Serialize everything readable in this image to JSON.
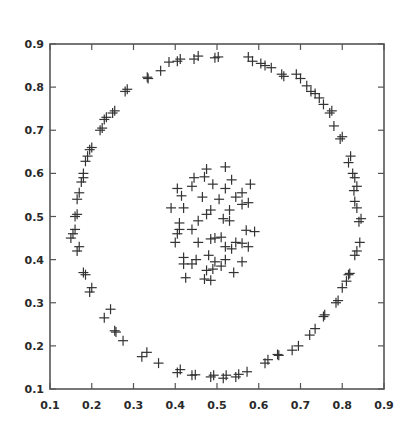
{
  "chart_data": {
    "type": "scatter",
    "title": "",
    "xlabel": "",
    "ylabel": "",
    "xlim": [
      0.1,
      0.9
    ],
    "ylim": [
      0.1,
      0.9
    ],
    "grid": false,
    "legend": null,
    "marker": "+",
    "marker_color": "#333333",
    "x_ticks": [
      "0.1",
      "0.2",
      "0.3",
      "0.4",
      "0.5",
      "0.6",
      "0.7",
      "0.8",
      "0.9"
    ],
    "y_ticks": [
      "0.1",
      "0.2",
      "0.3",
      "0.4",
      "0.5",
      "0.6",
      "0.7",
      "0.8",
      "0.9"
    ],
    "series": [
      {
        "name": "outer ring",
        "points": [
          [
            0.495,
            0.868
          ],
          [
            0.503,
            0.87
          ],
          [
            0.445,
            0.865
          ],
          [
            0.455,
            0.872
          ],
          [
            0.405,
            0.86
          ],
          [
            0.412,
            0.865
          ],
          [
            0.385,
            0.858
          ],
          [
            0.365,
            0.838
          ],
          [
            0.335,
            0.82
          ],
          [
            0.333,
            0.823
          ],
          [
            0.28,
            0.79
          ],
          [
            0.285,
            0.795
          ],
          [
            0.255,
            0.745
          ],
          [
            0.25,
            0.74
          ],
          [
            0.23,
            0.725
          ],
          [
            0.235,
            0.73
          ],
          [
            0.22,
            0.7
          ],
          [
            0.225,
            0.705
          ],
          [
            0.195,
            0.655
          ],
          [
            0.2,
            0.66
          ],
          [
            0.185,
            0.628
          ],
          [
            0.19,
            0.64
          ],
          [
            0.18,
            0.6
          ],
          [
            0.175,
            0.58
          ],
          [
            0.18,
            0.59
          ],
          [
            0.17,
            0.555
          ],
          [
            0.165,
            0.54
          ],
          [
            0.16,
            0.5
          ],
          [
            0.165,
            0.505
          ],
          [
            0.155,
            0.46
          ],
          [
            0.16,
            0.47
          ],
          [
            0.15,
            0.45
          ],
          [
            0.17,
            0.43
          ],
          [
            0.165,
            0.42
          ],
          [
            0.18,
            0.37
          ],
          [
            0.185,
            0.365
          ],
          [
            0.2,
            0.335
          ],
          [
            0.195,
            0.325
          ],
          [
            0.23,
            0.265
          ],
          [
            0.245,
            0.285
          ],
          [
            0.255,
            0.235
          ],
          [
            0.258,
            0.232
          ],
          [
            0.275,
            0.212
          ],
          [
            0.32,
            0.175
          ],
          [
            0.332,
            0.185
          ],
          [
            0.36,
            0.16
          ],
          [
            0.405,
            0.138
          ],
          [
            0.412,
            0.145
          ],
          [
            0.44,
            0.132
          ],
          [
            0.448,
            0.133
          ],
          [
            0.485,
            0.128
          ],
          [
            0.492,
            0.132
          ],
          [
            0.515,
            0.125
          ],
          [
            0.522,
            0.132
          ],
          [
            0.545,
            0.128
          ],
          [
            0.552,
            0.134
          ],
          [
            0.572,
            0.14
          ],
          [
            0.615,
            0.16
          ],
          [
            0.622,
            0.168
          ],
          [
            0.645,
            0.18
          ],
          [
            0.648,
            0.178
          ],
          [
            0.68,
            0.19
          ],
          [
            0.695,
            0.2
          ],
          [
            0.722,
            0.225
          ],
          [
            0.735,
            0.24
          ],
          [
            0.755,
            0.268
          ],
          [
            0.758,
            0.272
          ],
          [
            0.785,
            0.3
          ],
          [
            0.79,
            0.305
          ],
          [
            0.8,
            0.335
          ],
          [
            0.81,
            0.35
          ],
          [
            0.815,
            0.365
          ],
          [
            0.818,
            0.368
          ],
          [
            0.83,
            0.41
          ],
          [
            0.835,
            0.42
          ],
          [
            0.842,
            0.44
          ],
          [
            0.84,
            0.488
          ],
          [
            0.845,
            0.495
          ],
          [
            0.835,
            0.52
          ],
          [
            0.83,
            0.535
          ],
          [
            0.828,
            0.56
          ],
          [
            0.835,
            0.57
          ],
          [
            0.83,
            0.59
          ],
          [
            0.825,
            0.6
          ],
          [
            0.815,
            0.625
          ],
          [
            0.82,
            0.64
          ],
          [
            0.795,
            0.68
          ],
          [
            0.8,
            0.685
          ],
          [
            0.78,
            0.71
          ],
          [
            0.77,
            0.74
          ],
          [
            0.775,
            0.745
          ],
          [
            0.755,
            0.76
          ],
          [
            0.745,
            0.775
          ],
          [
            0.735,
            0.785
          ],
          [
            0.725,
            0.79
          ],
          [
            0.715,
            0.803
          ],
          [
            0.7,
            0.82
          ],
          [
            0.69,
            0.83
          ],
          [
            0.66,
            0.825
          ],
          [
            0.655,
            0.83
          ],
          [
            0.63,
            0.845
          ],
          [
            0.615,
            0.85
          ],
          [
            0.605,
            0.855
          ],
          [
            0.585,
            0.86
          ],
          [
            0.575,
            0.87
          ]
        ]
      },
      {
        "name": "inner cluster",
        "points": [
          [
            0.475,
            0.61
          ],
          [
            0.52,
            0.615
          ],
          [
            0.445,
            0.59
          ],
          [
            0.47,
            0.592
          ],
          [
            0.535,
            0.585
          ],
          [
            0.58,
            0.575
          ],
          [
            0.49,
            0.575
          ],
          [
            0.405,
            0.565
          ],
          [
            0.44,
            0.57
          ],
          [
            0.52,
            0.565
          ],
          [
            0.56,
            0.555
          ],
          [
            0.545,
            0.545
          ],
          [
            0.415,
            0.548
          ],
          [
            0.465,
            0.545
          ],
          [
            0.505,
            0.54
          ],
          [
            0.56,
            0.528
          ],
          [
            0.575,
            0.532
          ],
          [
            0.39,
            0.52
          ],
          [
            0.42,
            0.52
          ],
          [
            0.485,
            0.515
          ],
          [
            0.475,
            0.505
          ],
          [
            0.53,
            0.515
          ],
          [
            0.515,
            0.495
          ],
          [
            0.53,
            0.49
          ],
          [
            0.455,
            0.49
          ],
          [
            0.41,
            0.485
          ],
          [
            0.41,
            0.47
          ],
          [
            0.44,
            0.47
          ],
          [
            0.405,
            0.46
          ],
          [
            0.57,
            0.468
          ],
          [
            0.59,
            0.465
          ],
          [
            0.495,
            0.45
          ],
          [
            0.51,
            0.452
          ],
          [
            0.485,
            0.448
          ],
          [
            0.455,
            0.44
          ],
          [
            0.4,
            0.44
          ],
          [
            0.545,
            0.44
          ],
          [
            0.56,
            0.438
          ],
          [
            0.535,
            0.425
          ],
          [
            0.52,
            0.43
          ],
          [
            0.575,
            0.43
          ],
          [
            0.42,
            0.405
          ],
          [
            0.45,
            0.4
          ],
          [
            0.48,
            0.41
          ],
          [
            0.495,
            0.395
          ],
          [
            0.52,
            0.4
          ],
          [
            0.56,
            0.395
          ],
          [
            0.44,
            0.39
          ],
          [
            0.42,
            0.39
          ],
          [
            0.475,
            0.375
          ],
          [
            0.49,
            0.378
          ],
          [
            0.51,
            0.385
          ],
          [
            0.54,
            0.37
          ],
          [
            0.425,
            0.358
          ],
          [
            0.47,
            0.355
          ],
          [
            0.485,
            0.352
          ]
        ]
      }
    ]
  }
}
